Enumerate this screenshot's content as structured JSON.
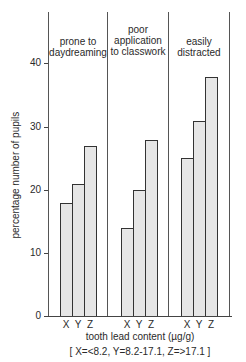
{
  "chart_data": {
    "type": "bar",
    "title": "",
    "ylabel": "percentage number of pupils",
    "xlabel": "tooth lead content (µg/g)",
    "xlabel_note": "[ X=<8.2,  Y=8.2-17.1,  Z=>17.1 ]",
    "ylim": [
      0,
      45
    ],
    "yticks": [
      0,
      10,
      20,
      30,
      40
    ],
    "grid": false,
    "legend": null,
    "categories": [
      "X",
      "Y",
      "Z"
    ],
    "groups": [
      {
        "name": "prone to daydreaming",
        "label_lines": [
          "prone to",
          "daydreaming"
        ],
        "values": [
          18,
          21,
          27
        ]
      },
      {
        "name": "poor application to classwork",
        "label_lines": [
          "poor",
          "application",
          "to classwork"
        ],
        "values": [
          14,
          20,
          28
        ]
      },
      {
        "name": "easily distracted",
        "label_lines": [
          "easily",
          "distracted"
        ],
        "values": [
          25,
          31,
          38
        ]
      }
    ]
  },
  "axis": {
    "tick_labels": [
      "0",
      "10",
      "20",
      "30",
      "40"
    ]
  }
}
